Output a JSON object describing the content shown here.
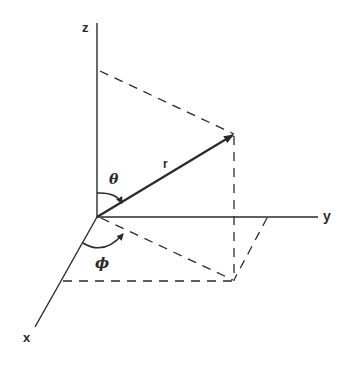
{
  "diagram": {
    "axes": {
      "x_label": "x",
      "y_label": "y",
      "z_label": "z"
    },
    "vector_label": "r",
    "angles": {
      "theta_label": "θ",
      "phi_label": "ϕ"
    },
    "colors": {
      "ink": "#2a2a2a",
      "background": "#ffffff"
    }
  }
}
